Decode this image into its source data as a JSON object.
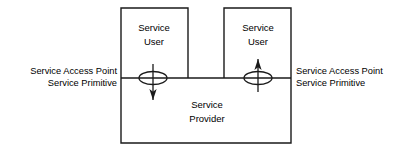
{
  "diagram": {
    "stroke_color": "#1a1a1a",
    "background_color": "#ffffff",
    "text_color": "#000000",
    "boxes": {
      "left_user": {
        "line1": "Service",
        "line2": "User"
      },
      "right_user": {
        "line1": "Service",
        "line2": "User"
      },
      "provider": {
        "line1": "Service",
        "line2": "Provider"
      }
    },
    "left_labels": {
      "line1": "Service Access Point",
      "line2": "Service Primitive"
    },
    "right_labels": {
      "line1": "Service Access Point",
      "line2": "Service Primitive"
    },
    "connectors": {
      "left": {
        "name": "downward-primitive-arrow",
        "direction": "down"
      },
      "right": {
        "name": "upward-primitive-arrow",
        "direction": "up"
      }
    }
  }
}
